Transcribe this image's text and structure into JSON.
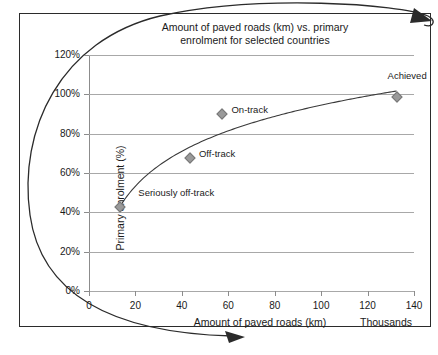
{
  "chart_data": {
    "type": "scatter",
    "title": "Amount of paved roads (km) vs. primary\nenrolment for selected countries",
    "xlabel": "Amount of paved roads (km)",
    "ylabel": "Primary enrolment (%)",
    "x_units_note": "Thousands",
    "xlim": [
      0,
      140
    ],
    "ylim": [
      0,
      120
    ],
    "xticks": [
      "0",
      "20",
      "40",
      "60",
      "80",
      "100",
      "120",
      "140"
    ],
    "xtick_values": [
      0,
      20,
      40,
      60,
      80,
      100,
      120,
      140
    ],
    "yticks": [
      "0%",
      "20%",
      "40%",
      "60%",
      "80%",
      "100%",
      "120%"
    ],
    "ytick_values": [
      0,
      20,
      40,
      60,
      80,
      100,
      120
    ],
    "grid": "horizontal",
    "legend": "none",
    "marker_color": "#9a9a9a",
    "trend_color": "#3a3a3a",
    "points": [
      {
        "label": "Seriously off-track",
        "x": 13.5,
        "y": 42.5,
        "label_dx": 18,
        "label_dy": -15
      },
      {
        "label": "Off-track",
        "x": 43.5,
        "y": 67.5,
        "label_dx": 9,
        "label_dy": -5
      },
      {
        "label": "On-track",
        "x": 57.5,
        "y": 90.0,
        "label_dx": 9,
        "label_dy": -5
      },
      {
        "label": "Achieved",
        "x": 132.5,
        "y": 98.5,
        "label_dx": -9,
        "label_dy": -22
      }
    ],
    "trend": {
      "type": "logarithmic",
      "description": "rising logarithmic trend line through the four points"
    },
    "annotation": {
      "type": "hand-drawn-ellipse-with-arrow",
      "description": "large elliptical loop drawn around the chart with an arrowhead"
    }
  }
}
